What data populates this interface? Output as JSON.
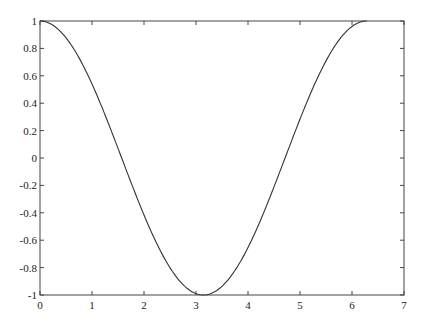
{
  "chart_data": {
    "type": "line",
    "title": "",
    "xlabel": "",
    "ylabel": "",
    "xlim": [
      0,
      7
    ],
    "ylim": [
      -1,
      1
    ],
    "grid": false,
    "legend": null,
    "x_ticks": [
      0,
      1,
      2,
      3,
      4,
      5,
      6,
      7
    ],
    "x_tick_labels": [
      "0",
      "1",
      "2",
      "3",
      "4",
      "5",
      "6",
      "7"
    ],
    "y_ticks": [
      -1,
      -0.8,
      -0.6,
      -0.4,
      -0.2,
      0,
      0.2,
      0.4,
      0.6,
      0.8,
      1
    ],
    "y_tick_labels": [
      "-1",
      "-0.8",
      "-0.6",
      "-0.4",
      "-0.2",
      "0",
      "0.2",
      "0.4",
      "0.6",
      "0.8",
      "1"
    ],
    "series": [
      {
        "name": "cos(x)",
        "color": "#333333",
        "x": [
          0,
          0.5,
          1.0,
          1.5,
          2.0,
          2.5,
          3.0,
          3.1416,
          3.5,
          4.0,
          4.5,
          5.0,
          5.5,
          6.0,
          6.2832
        ],
        "y": [
          1,
          0.878,
          0.54,
          0.071,
          -0.416,
          -0.801,
          -0.99,
          -1,
          -0.936,
          -0.654,
          -0.211,
          0.284,
          0.709,
          0.96,
          1
        ]
      }
    ]
  },
  "colors": {
    "axis": "#444444",
    "line": "#333333",
    "background": "#ffffff"
  }
}
